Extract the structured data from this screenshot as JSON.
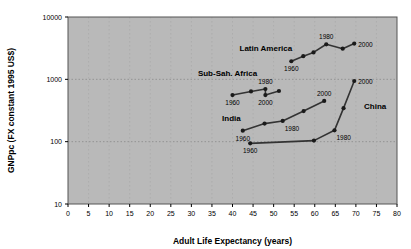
{
  "chart_data": {
    "type": "line",
    "title": "",
    "xlabel": "Adult Life Expectancy (years)",
    "ylabel": "GNPpc (FX constant 1995 US$)",
    "xlim": [
      0,
      80
    ],
    "ylim": [
      10,
      10000
    ],
    "yscale": "log",
    "xscale": "linear",
    "grid": true,
    "legend_position": "inline-annotations",
    "plot_bg_color": "#b9b9b9",
    "line_color": "#333333",
    "marker_color": "#1a1a1a",
    "xticks": [
      "0",
      "5",
      "10",
      "15",
      "20",
      "25",
      "30",
      "35",
      "40",
      "45",
      "50",
      "55",
      "60",
      "65",
      "70",
      "75",
      "80"
    ],
    "xtick_values": [
      0,
      5,
      10,
      15,
      20,
      25,
      30,
      35,
      40,
      45,
      50,
      55,
      60,
      65,
      70,
      75,
      80
    ],
    "yticks": [
      "10",
      "100",
      "1000",
      "10000"
    ],
    "ytick_values": [
      10,
      100,
      1000,
      10000
    ],
    "series": [
      {
        "name": "Latin America",
        "label_x": 54.5,
        "label_y": 2900,
        "label_anchor": "end",
        "points": [
          {
            "x": 54.3,
            "y": 1950,
            "year": "1960",
            "year_pos": "below"
          },
          {
            "x": 57.2,
            "y": 2350,
            "year": "",
            "year_pos": ""
          },
          {
            "x": 59.7,
            "y": 2700,
            "year": "",
            "year_pos": ""
          },
          {
            "x": 62.8,
            "y": 3650,
            "year": "1980",
            "year_pos": "above"
          },
          {
            "x": 66.8,
            "y": 3100,
            "year": "",
            "year_pos": ""
          },
          {
            "x": 69.6,
            "y": 3750,
            "year": "2000",
            "year_pos": "right"
          }
        ]
      },
      {
        "name": "Sub-Sah. Africa",
        "label_x": 46.0,
        "label_y": 1150,
        "label_anchor": "end",
        "points": [
          {
            "x": 40.0,
            "y": 560,
            "year": "1960",
            "year_pos": "below"
          },
          {
            "x": 44.5,
            "y": 640,
            "year": "",
            "year_pos": ""
          },
          {
            "x": 48.0,
            "y": 700,
            "year": "1980",
            "year_pos": "above"
          },
          {
            "x": 48.0,
            "y": 560,
            "year": "2000",
            "year_pos": "below"
          },
          {
            "x": 51.3,
            "y": 650,
            "year": "",
            "year_pos": ""
          }
        ]
      },
      {
        "name": "India",
        "label_x": 42.0,
        "label_y": 215,
        "label_anchor": "end",
        "points": [
          {
            "x": 42.5,
            "y": 150,
            "year": "1960",
            "year_pos": "below"
          },
          {
            "x": 47.8,
            "y": 195,
            "year": "",
            "year_pos": ""
          },
          {
            "x": 52.2,
            "y": 215,
            "year": "1980",
            "year_pos": "below-right"
          },
          {
            "x": 57.3,
            "y": 310,
            "year": "",
            "year_pos": ""
          },
          {
            "x": 62.3,
            "y": 450,
            "year": "2000",
            "year_pos": "above"
          }
        ]
      },
      {
        "name": "China",
        "label_x": 72.0,
        "label_y": 330,
        "label_anchor": "start",
        "points": [
          {
            "x": 44.3,
            "y": 94,
            "year": "1960",
            "year_pos": "below"
          },
          {
            "x": 59.8,
            "y": 104,
            "year": "",
            "year_pos": ""
          },
          {
            "x": 64.8,
            "y": 152,
            "year": "1980",
            "year_pos": "below-right"
          },
          {
            "x": 67.0,
            "y": 345,
            "year": "",
            "year_pos": ""
          },
          {
            "x": 69.6,
            "y": 940,
            "year": "2000",
            "year_pos": "right"
          }
        ]
      }
    ]
  }
}
